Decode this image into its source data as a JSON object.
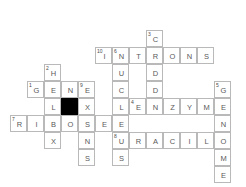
{
  "puzzle": {
    "type": "crossword",
    "theme": "molecular-biology",
    "grid": {
      "cell_size": 17,
      "origin_x": 10,
      "origin_y": 30,
      "columns": 13,
      "rows": 9
    },
    "cells": [
      {
        "c": 8,
        "r": 0,
        "letter": "C",
        "number": "3"
      },
      {
        "c": 5,
        "r": 1,
        "letter": "I",
        "number": "10"
      },
      {
        "c": 6,
        "r": 1,
        "letter": "N",
        "number": "6"
      },
      {
        "c": 7,
        "r": 1,
        "letter": "T",
        "number": ""
      },
      {
        "c": 8,
        "r": 1,
        "letter": "R",
        "number": ""
      },
      {
        "c": 9,
        "r": 1,
        "letter": "O",
        "number": ""
      },
      {
        "c": 10,
        "r": 1,
        "letter": "N",
        "number": ""
      },
      {
        "c": 11,
        "r": 1,
        "letter": "S",
        "number": ""
      },
      {
        "c": 2,
        "r": 2,
        "letter": "H",
        "number": "2"
      },
      {
        "c": 6,
        "r": 2,
        "letter": "U",
        "number": ""
      },
      {
        "c": 8,
        "r": 2,
        "letter": "D",
        "number": ""
      },
      {
        "c": 1,
        "r": 3,
        "letter": "G",
        "number": "1"
      },
      {
        "c": 2,
        "r": 3,
        "letter": "E",
        "number": ""
      },
      {
        "c": 3,
        "r": 3,
        "letter": "N",
        "number": ""
      },
      {
        "c": 4,
        "r": 3,
        "letter": "E",
        "number": "9"
      },
      {
        "c": 6,
        "r": 3,
        "letter": "C",
        "number": ""
      },
      {
        "c": 8,
        "r": 3,
        "letter": "D",
        "number": ""
      },
      {
        "c": 12,
        "r": 3,
        "letter": "G",
        "number": "5"
      },
      {
        "c": 2,
        "r": 4,
        "letter": "L",
        "number": ""
      },
      {
        "c": 3,
        "r": 4,
        "letter": "",
        "number": "",
        "block": true
      },
      {
        "c": 4,
        "r": 4,
        "letter": "X",
        "number": ""
      },
      {
        "c": 6,
        "r": 4,
        "letter": "L",
        "number": ""
      },
      {
        "c": 7,
        "r": 4,
        "letter": "E",
        "number": "4"
      },
      {
        "c": 8,
        "r": 4,
        "letter": "N",
        "number": ""
      },
      {
        "c": 9,
        "r": 4,
        "letter": "Z",
        "number": ""
      },
      {
        "c": 10,
        "r": 4,
        "letter": "Y",
        "number": ""
      },
      {
        "c": 11,
        "r": 4,
        "letter": "M",
        "number": ""
      },
      {
        "c": 12,
        "r": 4,
        "letter": "E",
        "number": ""
      },
      {
        "c": 0,
        "r": 5,
        "letter": "R",
        "number": "7"
      },
      {
        "c": 1,
        "r": 5,
        "letter": "I",
        "number": ""
      },
      {
        "c": 2,
        "r": 5,
        "letter": "B",
        "number": ""
      },
      {
        "c": 3,
        "r": 5,
        "letter": "O",
        "number": ""
      },
      {
        "c": 4,
        "r": 5,
        "letter": "S",
        "number": ""
      },
      {
        "c": 5,
        "r": 5,
        "letter": "E",
        "number": ""
      },
      {
        "c": 6,
        "r": 5,
        "letter": "E",
        "number": ""
      },
      {
        "c": 12,
        "r": 5,
        "letter": "N",
        "number": ""
      },
      {
        "c": 2,
        "r": 6,
        "letter": "X",
        "number": ""
      },
      {
        "c": 4,
        "r": 6,
        "letter": "N",
        "number": ""
      },
      {
        "c": 6,
        "r": 6,
        "letter": "U",
        "number": "8"
      },
      {
        "c": 7,
        "r": 6,
        "letter": "R",
        "number": ""
      },
      {
        "c": 8,
        "r": 6,
        "letter": "A",
        "number": ""
      },
      {
        "c": 9,
        "r": 6,
        "letter": "C",
        "number": ""
      },
      {
        "c": 10,
        "r": 6,
        "letter": "I",
        "number": ""
      },
      {
        "c": 11,
        "r": 6,
        "letter": "L",
        "number": ""
      },
      {
        "c": 12,
        "r": 6,
        "letter": "O",
        "number": ""
      },
      {
        "c": 4,
        "r": 7,
        "letter": "S",
        "number": ""
      },
      {
        "c": 6,
        "r": 7,
        "letter": "S",
        "number": ""
      },
      {
        "c": 12,
        "r": 7,
        "letter": "M",
        "number": ""
      },
      {
        "c": 12,
        "r": 8,
        "letter": "E",
        "number": ""
      }
    ],
    "answers": {
      "across": [
        {
          "number": "1",
          "text": "GENE"
        },
        {
          "number": "4",
          "text": "ENZYME"
        },
        {
          "number": "6",
          "text": "INTRONS"
        },
        {
          "number": "7",
          "text": "RIBOSE"
        },
        {
          "number": "8",
          "text": "URACIL"
        }
      ],
      "down": [
        {
          "number": "2",
          "text": "HELIX"
        },
        {
          "number": "3",
          "text": "CODON"
        },
        {
          "number": "5",
          "text": "GENOME"
        },
        {
          "number": "6",
          "text": "NUCLEUS"
        },
        {
          "number": "9",
          "text": "EXONS"
        }
      ]
    },
    "colors": {
      "grid_line": "#b9b9b9",
      "block": "#000000",
      "letter": "#5a5a5a",
      "number": "#4a4a4a",
      "background": "#ffffff"
    }
  }
}
